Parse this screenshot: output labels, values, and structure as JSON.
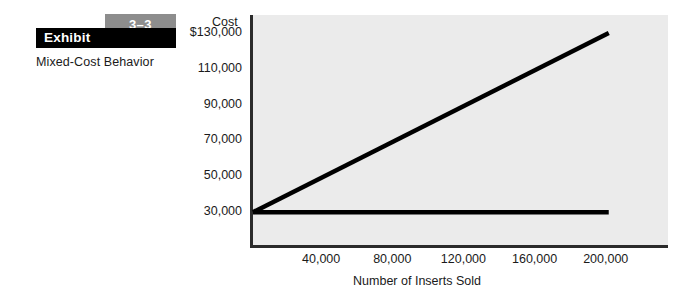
{
  "exhibit": {
    "number": "3–3",
    "word": "Exhibit",
    "caption": "Mixed-Cost Behavior",
    "bar_color": "#000000",
    "number_box_color": "#8d8d8d"
  },
  "chart_data": {
    "type": "line",
    "title": "Mixed-Cost Behavior",
    "xlabel": "Number of Inserts Sold",
    "ylabel": "Cost",
    "plot_background": "#ebebeb",
    "line_color": "#000000",
    "grid": false,
    "legend": null,
    "xlim": [
      0,
      235000
    ],
    "ylim": [
      10000,
      140000
    ],
    "x_ticks": [
      40000,
      80000,
      120000,
      160000,
      200000
    ],
    "x_tick_labels": [
      "40,000",
      "80,000",
      "120,000",
      "160,000",
      "200,000"
    ],
    "y_ticks": [
      30000,
      50000,
      70000,
      90000,
      110000,
      130000
    ],
    "y_tick_labels": [
      "30,000",
      "50,000",
      "70,000",
      "90,000",
      "110,000",
      "$130,000"
    ],
    "series": [
      {
        "name": "Total mixed cost",
        "x": [
          0,
          200000
        ],
        "values": [
          30000,
          130000
        ]
      },
      {
        "name": "Fixed cost component",
        "x": [
          0,
          200000
        ],
        "values": [
          30000,
          30000
        ]
      }
    ]
  }
}
